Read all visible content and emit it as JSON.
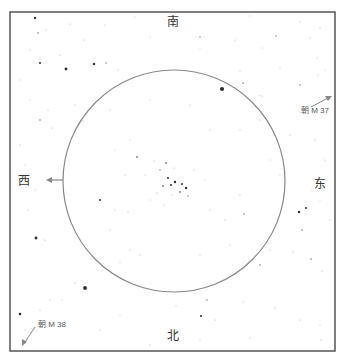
{
  "title_partial": "",
  "directions": {
    "north": "北",
    "south": "南",
    "east": "东",
    "west": "西"
  },
  "pointers": [
    {
      "label": "朝 M 37",
      "direction": "up-right"
    },
    {
      "label": "朝 M 38",
      "direction": "down-left"
    }
  ],
  "colors": {
    "frame": "#555555",
    "circle": "#888888",
    "arrow": "#888888",
    "star": "#222222"
  },
  "frame": {
    "x": 10,
    "y": 12,
    "width": 325,
    "height": 339
  },
  "field_circle": {
    "cx": 174,
    "cy": 181,
    "r": 111
  },
  "stars": [
    [
      35,
      18,
      1.2
    ],
    [
      46,
      30,
      0.6
    ],
    [
      70,
      24,
      0.6
    ],
    [
      105,
      25,
      0.6
    ],
    [
      135,
      17,
      0.5
    ],
    [
      250,
      16,
      0.5
    ],
    [
      300,
      22,
      0.5
    ],
    [
      320,
      28,
      0.6
    ],
    [
      38,
      33,
      0.8
    ],
    [
      84,
      40,
      0.6
    ],
    [
      150,
      37,
      0.5
    ],
    [
      200,
      37,
      0.7
    ],
    [
      235,
      40,
      0.5
    ],
    [
      276,
      36,
      0.7
    ],
    [
      310,
      38,
      0.6
    ],
    [
      30,
      50,
      0.5
    ],
    [
      60,
      55,
      0.6
    ],
    [
      90,
      66,
      0.5
    ],
    [
      200,
      48,
      0.5
    ],
    [
      262,
      48,
      0.5
    ],
    [
      317,
      58,
      0.6
    ],
    [
      40,
      63,
      1.0
    ],
    [
      66,
      69,
      1.4
    ],
    [
      94,
      64,
      1.2
    ],
    [
      106,
      63,
      0.7
    ],
    [
      118,
      70,
      0.5
    ],
    [
      240,
      71,
      0.6
    ],
    [
      280,
      68,
      0.5
    ],
    [
      325,
      70,
      0.5
    ],
    [
      222,
      89,
      2.1
    ],
    [
      243,
      83,
      0.8
    ],
    [
      262,
      96,
      0.6
    ],
    [
      300,
      85,
      0.8
    ],
    [
      318,
      75,
      0.5
    ],
    [
      20,
      80,
      0.5
    ],
    [
      30,
      100,
      0.5
    ],
    [
      48,
      110,
      0.6
    ],
    [
      75,
      105,
      0.5
    ],
    [
      40,
      120,
      0.8
    ],
    [
      82,
      120,
      0.6
    ],
    [
      52,
      128,
      0.6
    ],
    [
      260,
      120,
      0.6
    ],
    [
      300,
      112,
      0.5
    ],
    [
      290,
      135,
      0.6
    ],
    [
      315,
      140,
      0.6
    ],
    [
      325,
      160,
      0.5
    ],
    [
      110,
      110,
      0.5
    ],
    [
      150,
      100,
      0.5
    ],
    [
      190,
      105,
      0.5
    ],
    [
      210,
      130,
      0.5
    ],
    [
      240,
      130,
      0.6
    ],
    [
      130,
      140,
      0.5
    ],
    [
      20,
      145,
      0.5
    ],
    [
      25,
      165,
      0.5
    ],
    [
      35,
      190,
      0.6
    ],
    [
      28,
      210,
      0.5
    ],
    [
      45,
      240,
      0.6
    ],
    [
      36,
      238,
      1.4
    ],
    [
      137,
      157,
      0.9
    ],
    [
      154,
      161,
      0.6
    ],
    [
      166,
      163,
      0.9
    ],
    [
      174,
      168,
      0.6
    ],
    [
      160,
      170,
      0.7
    ],
    [
      168,
      178,
      1.1
    ],
    [
      175,
      182,
      1.2
    ],
    [
      171,
      185,
      1.0
    ],
    [
      163,
      186,
      0.9
    ],
    [
      182,
      184,
      1.0
    ],
    [
      186,
      188,
      1.2
    ],
    [
      180,
      192,
      0.9
    ],
    [
      157,
      193,
      0.6
    ],
    [
      172,
      195,
      0.6
    ],
    [
      188,
      196,
      0.7
    ],
    [
      164,
      205,
      0.6
    ],
    [
      194,
      170,
      0.5
    ],
    [
      145,
      175,
      0.5
    ],
    [
      205,
      180,
      0.5
    ],
    [
      150,
      200,
      0.5
    ],
    [
      100,
      200,
      1.0
    ],
    [
      115,
      210,
      0.6
    ],
    [
      128,
      212,
      0.6
    ],
    [
      210,
      210,
      0.6
    ],
    [
      225,
      220,
      0.6
    ],
    [
      240,
      195,
      0.6
    ],
    [
      244,
      214,
      0.8
    ],
    [
      299,
      212,
      1.2
    ],
    [
      306,
      208,
      1.0
    ],
    [
      302,
      230,
      0.8
    ],
    [
      293,
      252,
      0.6
    ],
    [
      311,
      259,
      0.8
    ],
    [
      322,
      271,
      0.6
    ],
    [
      312,
      190,
      0.5
    ],
    [
      320,
      200,
      0.5
    ],
    [
      330,
      220,
      0.5
    ],
    [
      270,
      250,
      0.5
    ],
    [
      260,
      265,
      0.8
    ],
    [
      85,
      288,
      1.9
    ],
    [
      102,
      271,
      0.6
    ],
    [
      120,
      262,
      0.5
    ],
    [
      140,
      255,
      0.5
    ],
    [
      200,
      255,
      0.6
    ],
    [
      230,
      245,
      0.6
    ],
    [
      75,
      283,
      0.6
    ],
    [
      62,
      300,
      0.5
    ],
    [
      40,
      310,
      0.6
    ],
    [
      20,
      314,
      1.3
    ],
    [
      25,
      330,
      0.6
    ],
    [
      27,
      340,
      0.6
    ],
    [
      50,
      300,
      0.6
    ],
    [
      176,
      306,
      0.6
    ],
    [
      201,
      316,
      1.1
    ],
    [
      207,
      300,
      0.8
    ],
    [
      215,
      320,
      0.6
    ],
    [
      243,
      302,
      0.6
    ],
    [
      275,
      308,
      0.6
    ],
    [
      300,
      320,
      0.6
    ],
    [
      320,
      325,
      0.5
    ],
    [
      321,
      340,
      0.6
    ],
    [
      200,
      340,
      0.5
    ],
    [
      250,
      338,
      0.5
    ],
    [
      100,
      330,
      0.5
    ],
    [
      120,
      315,
      0.5
    ],
    [
      150,
      345,
      0.6
    ],
    [
      260,
      95,
      0.5
    ],
    [
      270,
      160,
      0.5
    ],
    [
      280,
      175,
      0.5
    ],
    [
      125,
      175,
      0.5
    ],
    [
      115,
      150,
      0.5
    ],
    [
      110,
      230,
      0.5
    ],
    [
      130,
      250,
      0.5
    ]
  ]
}
